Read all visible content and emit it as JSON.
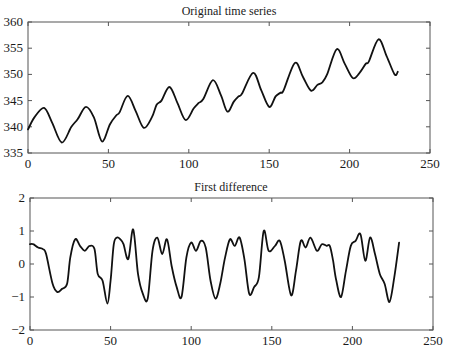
{
  "chart_data": [
    {
      "type": "line",
      "title": "Original time series",
      "xlabel": "",
      "ylabel": "",
      "xlim": [
        0,
        250
      ],
      "ylim": [
        335,
        360
      ],
      "xticks": [
        0,
        50,
        100,
        150,
        200,
        250
      ],
      "yticks": [
        335,
        340,
        345,
        350,
        355,
        360
      ],
      "grid": false,
      "legend": null,
      "series": [
        {
          "name": "Original time series",
          "x": [
            0,
            4,
            10,
            15,
            21,
            27,
            31,
            36,
            41,
            46,
            51,
            55,
            57,
            62,
            67,
            72,
            77,
            80,
            83,
            88,
            93,
            98,
            103,
            106,
            109,
            115,
            120,
            124,
            128,
            131,
            133,
            140,
            145,
            150,
            154,
            157,
            159,
            166,
            171,
            176,
            180,
            183,
            186,
            192,
            197,
            202,
            206,
            210,
            212,
            218,
            223,
            228,
            230
          ],
          "values": [
            339.5,
            341.8,
            343.6,
            340.8,
            337.0,
            340.0,
            341.5,
            343.8,
            341.8,
            337.2,
            340.5,
            342.2,
            342.8,
            345.9,
            343.0,
            339.8,
            341.8,
            344.2,
            345.0,
            347.6,
            344.5,
            341.3,
            343.5,
            344.5,
            345.3,
            348.9,
            346.0,
            342.9,
            344.8,
            345.8,
            346.3,
            350.3,
            347.0,
            343.8,
            345.8,
            346.5,
            347.0,
            352.2,
            349.5,
            346.9,
            348.0,
            348.5,
            350.0,
            354.8,
            352.0,
            349.3,
            350.2,
            352.0,
            352.5,
            356.7,
            353.5,
            350.0,
            350.5
          ]
        }
      ]
    },
    {
      "type": "line",
      "title": "First difference",
      "xlabel": "",
      "ylabel": "",
      "xlim": [
        0,
        250
      ],
      "ylim": [
        -2,
        2
      ],
      "xticks": [
        0,
        50,
        100,
        150,
        200,
        250
      ],
      "yticks": [
        -2,
        -1,
        0,
        1,
        2
      ],
      "grid": false,
      "legend": null,
      "series": [
        {
          "name": "First difference",
          "x": [
            0,
            2,
            5,
            8,
            10,
            14,
            17,
            20,
            23,
            25,
            28,
            31,
            34,
            37,
            40,
            42,
            45,
            48,
            50,
            52,
            54,
            56,
            58,
            61,
            64,
            67,
            70,
            73,
            76,
            79,
            82,
            85,
            88,
            91,
            94,
            97,
            100,
            103,
            106,
            109,
            112,
            115,
            118,
            121,
            124,
            127,
            130,
            133,
            136,
            139,
            142,
            145,
            148,
            152,
            155,
            158,
            162,
            165,
            168,
            171,
            174,
            178,
            181,
            184,
            186,
            188,
            190,
            193,
            196,
            199,
            202,
            205,
            208,
            211,
            214,
            217,
            220,
            223,
            226,
            229
          ],
          "values": [
            0.6,
            0.6,
            0.5,
            0.45,
            0.3,
            -0.6,
            -0.85,
            -0.75,
            -0.6,
            0.2,
            0.75,
            0.55,
            0.4,
            0.55,
            0.45,
            -0.3,
            -0.5,
            -1.2,
            -0.5,
            0.6,
            0.8,
            0.75,
            0.6,
            0.15,
            1.05,
            -0.3,
            -0.9,
            -1.05,
            0.4,
            0.8,
            0.3,
            0.75,
            -0.1,
            -0.7,
            -1.0,
            0.2,
            0.65,
            0.4,
            0.7,
            0.5,
            -0.5,
            -1.05,
            -0.6,
            0.2,
            0.75,
            0.55,
            0.8,
            0.15,
            -0.9,
            -0.7,
            -0.4,
            1.0,
            0.4,
            0.55,
            0.7,
            0.1,
            -0.95,
            -0.2,
            0.7,
            0.5,
            0.8,
            0.4,
            0.6,
            0.55,
            0.55,
            0.1,
            -0.5,
            -1.0,
            -0.2,
            0.55,
            0.7,
            0.9,
            0.1,
            0.8,
            0.3,
            -0.3,
            -0.6,
            -1.15,
            -0.4,
            0.65
          ]
        }
      ]
    }
  ]
}
